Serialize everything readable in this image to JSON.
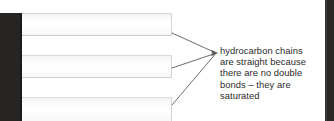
{
  "figure": {
    "type": "annotated-diagram",
    "background_color": "#ffffff",
    "gutter_color": "#262524"
  },
  "chains": {
    "label": "hydrocarbon-chain-bars",
    "count": 3,
    "items": [
      {
        "id": "chain-1",
        "fill_color": "#fbfbfb",
        "border_color": "#d4d4d4"
      },
      {
        "id": "chain-2",
        "fill_color": "#fbfbfb",
        "border_color": "#d4d4d4"
      },
      {
        "id": "chain-3",
        "fill_color": "#fbfbfb",
        "border_color": "#d4d4d4"
      }
    ]
  },
  "callout": {
    "text": "hydrocarbon chains\nare straight because\nthere are no double\nbonds – they are\nsaturated",
    "lines": [
      "hydrocarbon chains",
      "are straight because",
      "there are no double",
      "bonds – they are",
      "saturated"
    ],
    "text_color": "#2b2b2b",
    "arrow_color": "#555555",
    "leader_count": 3
  }
}
